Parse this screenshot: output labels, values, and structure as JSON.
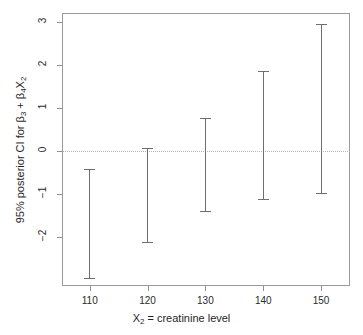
{
  "chart_data": {
    "type": "scatter",
    "subtype": "error-bar-interval-plot",
    "title": "",
    "xlabel": "X2 = creatinine level",
    "xlabel_parts": {
      "prefix": "X",
      "sub": "2",
      "suffix": " = creatinine level"
    },
    "ylabel": "95% posterior CI for β3 + β4X2",
    "ylabel_parts": {
      "lead": "95% posterior CI for β",
      "sub1": "3",
      "mid": " + β",
      "sub2": "4",
      "var": "X",
      "sub3": "2"
    },
    "x": [
      110,
      120,
      130,
      140,
      150
    ],
    "categories": [
      "110",
      "120",
      "130",
      "140",
      "150"
    ],
    "lower": [
      -2.99,
      -2.14,
      -1.44,
      -1.15,
      -1.01
    ],
    "upper": [
      -0.42,
      0.05,
      0.75,
      1.86,
      2.94
    ],
    "series": [
      {
        "name": "95% posterior credible interval",
        "points": [
          {
            "x": 110,
            "lower": -2.99,
            "upper": -0.42
          },
          {
            "x": 120,
            "lower": -2.14,
            "upper": 0.05
          },
          {
            "x": 130,
            "lower": -1.44,
            "upper": 0.75
          },
          {
            "x": 140,
            "lower": -1.15,
            "upper": 1.86
          },
          {
            "x": 150,
            "lower": -1.01,
            "upper": 2.94
          }
        ]
      }
    ],
    "xticks": [
      110,
      120,
      130,
      140,
      150
    ],
    "xticklabels": [
      "110",
      "120",
      "130",
      "140",
      "150"
    ],
    "yticks": [
      -2,
      -1,
      0,
      1,
      2,
      3
    ],
    "yticklabels": [
      "−2",
      "−1",
      "0",
      "1",
      "2",
      "3"
    ],
    "xlim": [
      105.2,
      155.0
    ],
    "ylim": [
      -3.15,
      3.2
    ],
    "grid": false,
    "legend": null,
    "reference_line": {
      "y": 0,
      "style": "dotted",
      "color": "#b4b4b4"
    },
    "colors": {
      "bar": "#6e6e6e",
      "frame": "#9a9a9a",
      "tick": "#8f8f8f",
      "text": "#1f1f1f",
      "background": "#ffffff"
    }
  }
}
